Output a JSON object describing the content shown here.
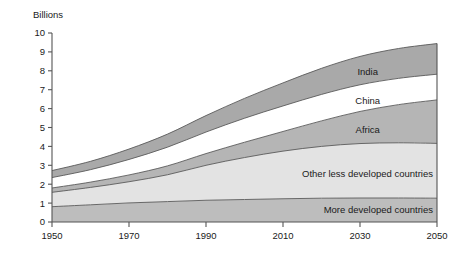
{
  "chart_data": {
    "type": "area",
    "stacked": true,
    "title": "",
    "subtitle": "",
    "xlabel": "",
    "ylabel": "Billions",
    "ylabel_position": "top-left",
    "grid": false,
    "legend": "inline-labels",
    "xlim": [
      1950,
      2050
    ],
    "ylim": [
      0,
      10
    ],
    "ytick_labels": [
      "0",
      "1",
      "2",
      "3",
      "4",
      "5",
      "6",
      "7",
      "8",
      "9",
      "10"
    ],
    "ytick_values": [
      0,
      1,
      2,
      3,
      4,
      5,
      6,
      7,
      8,
      9,
      10
    ],
    "xtick_labels": [
      "1950",
      "1970",
      "1990",
      "2010",
      "2030",
      "2050"
    ],
    "xtick_values": [
      1950,
      1970,
      1990,
      2010,
      2030,
      2050
    ],
    "x": [
      1950,
      1960,
      1970,
      1980,
      1990,
      2000,
      2010,
      2020,
      2030,
      2040,
      2050
    ],
    "series": [
      {
        "name": "More developed countries",
        "label": "More developed countries",
        "color": "#bdbdbd",
        "values": [
          0.81,
          0.91,
          1.01,
          1.08,
          1.15,
          1.19,
          1.23,
          1.26,
          1.27,
          1.27,
          1.26
        ]
      },
      {
        "name": "Other less developed countries",
        "label": "Other less developed countries",
        "color": "#e3e3e3",
        "values": [
          0.76,
          0.92,
          1.12,
          1.42,
          1.85,
          2.22,
          2.52,
          2.74,
          2.88,
          2.92,
          2.9
        ]
      },
      {
        "name": "Africa",
        "label": "Africa",
        "color": "#b5b5b5",
        "values": [
          0.23,
          0.28,
          0.36,
          0.47,
          0.62,
          0.81,
          1.04,
          1.35,
          1.7,
          2.02,
          2.3
        ]
      },
      {
        "name": "China",
        "label": "China",
        "color": "#ffffff",
        "values": [
          0.55,
          0.66,
          0.82,
          0.99,
          1.14,
          1.27,
          1.35,
          1.4,
          1.41,
          1.39,
          1.36
        ]
      },
      {
        "name": "India",
        "label": "India",
        "color": "#a9a9a9",
        "values": [
          0.37,
          0.44,
          0.55,
          0.69,
          0.87,
          1.05,
          1.22,
          1.38,
          1.5,
          1.58,
          1.62
        ]
      }
    ],
    "cumulative_tops": {
      "More developed countries": [
        0.81,
        0.91,
        1.01,
        1.08,
        1.15,
        1.19,
        1.23,
        1.26,
        1.27,
        1.27,
        1.26
      ],
      "Other less developed countries": [
        1.57,
        1.83,
        2.13,
        2.5,
        3.0,
        3.41,
        3.75,
        4.0,
        4.15,
        4.19,
        4.16
      ],
      "Africa": [
        1.8,
        2.11,
        2.49,
        2.97,
        3.62,
        4.22,
        4.79,
        5.35,
        5.85,
        6.21,
        6.46
      ],
      "China": [
        2.35,
        2.77,
        3.31,
        3.96,
        4.76,
        5.49,
        6.14,
        6.75,
        7.26,
        7.6,
        7.82
      ],
      "India": [
        2.72,
        3.21,
        3.86,
        4.65,
        5.63,
        6.54,
        7.36,
        8.13,
        8.76,
        9.18,
        9.44
      ]
    },
    "series_label_positions": [
      {
        "label": "India",
        "x": 2032,
        "y": 7.95
      },
      {
        "label": "China",
        "x": 2032,
        "y": 6.4
      },
      {
        "label": "Africa",
        "x": 2032,
        "y": 4.9
      },
      {
        "label": "Other less developed countries",
        "x": 2024,
        "y": 2.55
      },
      {
        "label": "More developed countries",
        "x": 2026,
        "y": 0.65
      }
    ]
  },
  "colors": {
    "background": "#ffffff",
    "axis": "#555555",
    "band_edge": "#5a5a5a",
    "text": "#1a1a1a",
    "india": "#a9a9a9",
    "china": "#ffffff",
    "africa": "#b5b5b5",
    "other_less_developed": "#e3e3e3",
    "more_developed": "#bdbdbd"
  }
}
